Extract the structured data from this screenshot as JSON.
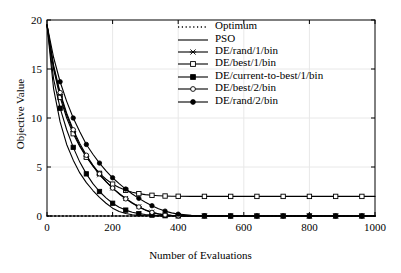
{
  "chart_data": {
    "type": "line",
    "title": "",
    "xlabel": "Number of Evaluations",
    "ylabel": "Objective Value",
    "xlim": [
      0,
      1000
    ],
    "ylim": [
      0,
      20
    ],
    "xticks": [
      0,
      200,
      400,
      600,
      800,
      1000
    ],
    "yticks": [
      0,
      5,
      10,
      15,
      20
    ],
    "grid": true,
    "legend_position": "upper-right-inside",
    "legend_border": false,
    "x": [
      0,
      20,
      40,
      60,
      80,
      100,
      120,
      140,
      160,
      180,
      200,
      220,
      240,
      260,
      280,
      300,
      320,
      340,
      360,
      380,
      400,
      440,
      480,
      520,
      560,
      600,
      640,
      680,
      720,
      760,
      800,
      840,
      880,
      920,
      960,
      1000
    ],
    "series": [
      {
        "name": "Optimum",
        "style": "dotted",
        "marker": "none",
        "color": "#000000",
        "values": [
          0,
          0,
          0,
          0,
          0,
          0,
          0,
          0,
          0,
          0,
          0,
          0,
          0,
          0,
          0,
          0,
          0,
          0,
          0,
          0,
          0,
          0,
          0,
          0,
          0,
          0,
          0,
          0,
          0,
          0,
          0,
          0,
          0,
          0,
          0,
          0
        ]
      },
      {
        "name": "PSO",
        "style": "solid",
        "marker": "none",
        "color": "#000000",
        "values": [
          19.5,
          13.0,
          9.6,
          7.3,
          5.7,
          4.4,
          3.4,
          2.6,
          1.9,
          1.3,
          0.8,
          0.45,
          0.25,
          0.13,
          0.07,
          0.03,
          0.02,
          0.01,
          0.0,
          0.0,
          0.0,
          0.0,
          0.0,
          0.0,
          0.0,
          0.0,
          0.0,
          0.0,
          0.0,
          0.0,
          0.0,
          0.0,
          0.0,
          0.0,
          0.0,
          0.0
        ]
      },
      {
        "name": "DE/rand/1/bin",
        "style": "solid",
        "marker": "x",
        "color": "#000000",
        "values": [
          19.5,
          15.2,
          12.4,
          10.3,
          8.6,
          7.2,
          6.1,
          5.1,
          4.2,
          3.5,
          2.85,
          2.3,
          1.8,
          1.35,
          0.95,
          0.62,
          0.38,
          0.22,
          0.12,
          0.06,
          0.03,
          0.01,
          0.0,
          0.0,
          0.0,
          0.0,
          0.0,
          0.0,
          0.0,
          0.0,
          0.0,
          0.0,
          0.0,
          0.0,
          0.0,
          0.0
        ]
      },
      {
        "name": "DE/best/1/bin",
        "style": "solid",
        "marker": "open-square",
        "color": "#000000",
        "values": [
          19.5,
          15.0,
          12.1,
          10.0,
          8.4,
          7.1,
          6.0,
          5.1,
          4.35,
          3.75,
          3.25,
          2.9,
          2.62,
          2.42,
          2.28,
          2.18,
          2.11,
          2.07,
          2.04,
          2.02,
          2.01,
          2.0,
          2.0,
          2.0,
          2.0,
          2.0,
          2.0,
          2.0,
          2.0,
          2.0,
          2.0,
          2.0,
          2.0,
          2.0,
          2.0,
          2.0
        ]
      },
      {
        "name": "DE/current-to-best/1/bin",
        "style": "solid",
        "marker": "filled-square",
        "color": "#000000",
        "values": [
          19.5,
          14.0,
          11.0,
          8.8,
          7.0,
          5.5,
          4.3,
          3.3,
          2.5,
          1.85,
          1.3,
          0.9,
          0.6,
          0.38,
          0.24,
          0.15,
          0.09,
          0.05,
          0.03,
          0.02,
          0.01,
          0.0,
          0.0,
          0.0,
          0.0,
          0.0,
          0.0,
          0.0,
          0.0,
          0.0,
          0.0,
          0.0,
          0.0,
          0.0,
          0.0,
          0.0
        ]
      },
      {
        "name": "DE/best/2/bin",
        "style": "solid",
        "marker": "open-circle",
        "color": "#000000",
        "values": [
          19.5,
          15.4,
          12.6,
          10.5,
          8.8,
          7.4,
          6.2,
          5.2,
          4.3,
          3.5,
          2.85,
          2.25,
          1.75,
          1.3,
          0.92,
          0.6,
          0.37,
          0.21,
          0.11,
          0.05,
          0.02,
          0.0,
          0.0,
          0.0,
          0.0,
          0.0,
          0.0,
          0.0,
          0.0,
          0.0,
          0.0,
          0.0,
          0.0,
          0.0,
          0.0,
          0.0
        ]
      },
      {
        "name": "DE/rand/2/bin",
        "style": "solid",
        "marker": "filled-circle",
        "color": "#000000",
        "values": [
          19.5,
          16.2,
          13.7,
          11.7,
          10.0,
          8.6,
          7.3,
          6.3,
          5.4,
          4.6,
          3.9,
          3.3,
          2.75,
          2.25,
          1.8,
          1.4,
          1.05,
          0.75,
          0.5,
          0.32,
          0.19,
          0.07,
          0.02,
          0.01,
          0.0,
          0.0,
          0.0,
          0.0,
          0.0,
          0.0,
          0.0,
          0.0,
          0.0,
          0.0,
          0.0,
          0.0
        ]
      }
    ]
  },
  "legend": {
    "items": [
      {
        "label": "Optimum"
      },
      {
        "label": "PSO"
      },
      {
        "label": "DE/rand/1/bin"
      },
      {
        "label": "DE/best/1/bin"
      },
      {
        "label": "DE/current-to-best/1/bin"
      },
      {
        "label": "DE/best/2/bin"
      },
      {
        "label": "DE/rand/2/bin"
      }
    ]
  },
  "colors": {
    "line": "#000000",
    "axis": "#000000",
    "grid": "#e8e8e8",
    "background": "#ffffff"
  }
}
